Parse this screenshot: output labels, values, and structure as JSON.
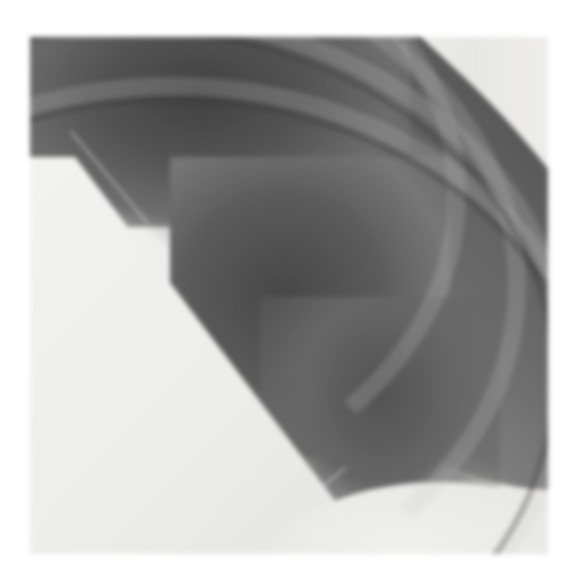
{
  "image": {
    "subject": "chest radiograph detail",
    "description": "Grayscale X-ray showing overlapping rib arcs and lung field on a white background",
    "alt": "Chest X-ray close-up of ribs and lung",
    "frame": {
      "x": 30,
      "y": 37,
      "width": 518,
      "height": 517
    },
    "colors": {
      "background": "#ffffff",
      "soft_tissue": "#e9e9e7",
      "lung_dark": "#4a4a4a",
      "lung_mid": "#6e6e6e",
      "right_margin": "#e2e2df"
    }
  }
}
